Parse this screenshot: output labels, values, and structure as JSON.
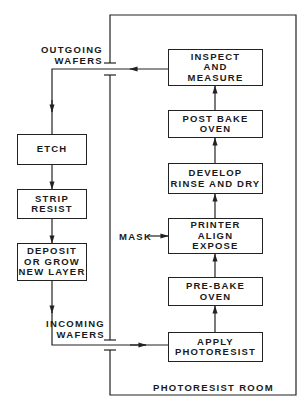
{
  "diagram": {
    "type": "process-flow",
    "room_label": "PHOTORESIST ROOM",
    "outgoing_label": [
      "OUTGOING",
      "WAFERS"
    ],
    "incoming_label": [
      "INCOMING",
      "WAFERS"
    ],
    "mask_label": "MASK",
    "room_steps": [
      {
        "id": "inspect",
        "lines": [
          "INSPECT",
          "AND",
          "MEASURE"
        ]
      },
      {
        "id": "post-bake",
        "lines": [
          "POST BAKE",
          "OVEN"
        ]
      },
      {
        "id": "develop",
        "lines": [
          "DEVELOP",
          "RINSE AND DRY"
        ]
      },
      {
        "id": "printer",
        "lines": [
          "PRINTER",
          "ALIGN",
          "EXPOSE"
        ]
      },
      {
        "id": "pre-bake",
        "lines": [
          "PRE-BAKE",
          "OVEN"
        ]
      },
      {
        "id": "apply",
        "lines": [
          "APPLY",
          "PHOTORESIST"
        ]
      }
    ],
    "outside_steps": [
      {
        "id": "etch",
        "lines": [
          "ETCH"
        ]
      },
      {
        "id": "strip",
        "lines": [
          "STRIP",
          "RESIST"
        ]
      },
      {
        "id": "deposit",
        "lines": [
          "DEPOSIT",
          "OR GROW",
          "NEW LAYER"
        ]
      }
    ],
    "colors": {
      "line": "#222222",
      "background": "#ffffff"
    }
  }
}
